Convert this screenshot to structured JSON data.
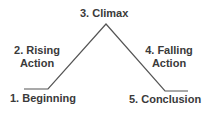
{
  "diagram": {
    "stages": [
      {
        "id": "beginning",
        "label": "1. Beginning"
      },
      {
        "id": "rising",
        "line1": "2. Rising",
        "line2": "Action"
      },
      {
        "id": "climax",
        "label": "3. Climax"
      },
      {
        "id": "falling",
        "line1": "4. Falling",
        "line2": "Action"
      },
      {
        "id": "conclusion",
        "label": "5. Conclusion"
      }
    ],
    "line_color": "#555555",
    "points": [
      [
        24,
        89
      ],
      [
        48,
        89
      ],
      [
        106,
        24
      ],
      [
        165,
        91
      ],
      [
        188,
        91
      ]
    ]
  }
}
